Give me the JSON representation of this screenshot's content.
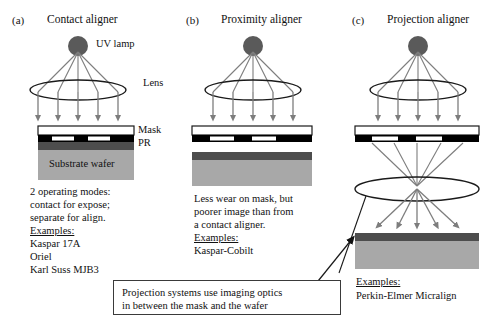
{
  "figure": {
    "type": "three-panel technical diagram"
  },
  "colors": {
    "lamp": "#5a5a5a",
    "ray": "#7d7d7d",
    "mask_plate": "#ffffff",
    "chrome": "#000000",
    "photoresist": "#4d4d4d",
    "substrate": "#a8a8a8",
    "outline": "#1a1a1a",
    "callout_border": "#3a3a3a"
  },
  "panels": [
    {
      "id": "a",
      "label": "(a)",
      "title": "Contact aligner",
      "annotations": {
        "lamp": "UV lamp",
        "lens": "Lens",
        "mask": "Mask",
        "pr": "PR",
        "substrate": "Substrate wafer"
      },
      "text_lines": [
        "2 operating modes:",
        "contact for expose;",
        "separate for align."
      ],
      "examples_heading": "Examples:",
      "examples": [
        "Kaspar 17A",
        "Oriel",
        "Karl Suss MJB3"
      ]
    },
    {
      "id": "b",
      "label": "(b)",
      "title": "Proximity aligner",
      "annotations": {},
      "text_lines": [
        "Less wear on mask, but",
        "poorer image than from",
        "a contact aligner."
      ],
      "examples_heading": "Examples:",
      "examples": [
        "Kaspar-Cobilt"
      ]
    },
    {
      "id": "c",
      "label": "(c)",
      "title": "Projection aligner",
      "annotations": {},
      "text_lines": [],
      "examples_heading": "Examples:",
      "examples": [
        "Perkin-Elmer Micralign"
      ]
    }
  ],
  "callout": {
    "lines": [
      "Projection systems use imaging optics",
      "in between the mask and the wafer"
    ]
  }
}
